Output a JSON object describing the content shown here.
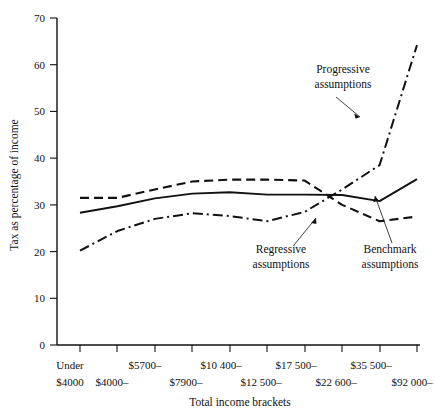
{
  "chart_data": {
    "type": "line",
    "title": "",
    "xlabel": "Total income brackets",
    "ylabel": "Tax as percentage of income",
    "ylim": [
      0,
      70
    ],
    "yticks": [
      0,
      10,
      20,
      30,
      40,
      50,
      60,
      70
    ],
    "ytick_labels": [
      "0",
      "10",
      "20",
      "30",
      "40",
      "50",
      "60",
      "70"
    ],
    "grid": false,
    "legend_position": "inline-annotations",
    "categories": [
      "Under $4000",
      "$4000–",
      "$5700–",
      "$7900–",
      "$10 400–",
      "$12 500–",
      "$17 500–",
      "$22 600–",
      "$35 500–",
      "$92 000–"
    ],
    "categories_upper": [
      "Under",
      "",
      "$5700–",
      "",
      "$10 400–",
      "",
      "$17 500–",
      "",
      "$35 500–",
      ""
    ],
    "categories_lower": [
      "$4000",
      "$4000–",
      "",
      "$7900–",
      "",
      "$12 500–",
      "",
      "$22 600–",
      "",
      "$92 000–"
    ],
    "series": [
      {
        "name": "Regressive assumptions",
        "style": "dashed",
        "values": [
          31.5,
          31.5,
          33.3,
          35.0,
          35.4,
          35.4,
          35.2,
          30.0,
          26.5,
          27.5
        ]
      },
      {
        "name": "Benchmark assumptions",
        "style": "solid",
        "values": [
          28.3,
          29.7,
          31.4,
          32.4,
          32.7,
          32.2,
          32.2,
          32.1,
          30.8,
          35.5
        ]
      },
      {
        "name": "Progressive assumptions",
        "style": "dash-dot",
        "values": [
          20.2,
          24.4,
          27.0,
          28.2,
          27.6,
          26.5,
          28.5,
          33.3,
          38.5,
          64.2
        ]
      }
    ],
    "annotations": [
      {
        "text_line1": "Progressive",
        "text_line2": "assumptions"
      },
      {
        "text_line1": "Regressive",
        "text_line2": "assumptions"
      },
      {
        "text_line1": "Benchmark",
        "text_line2": "assumptions"
      }
    ],
    "colors": {
      "axis": "#111111",
      "series": "#111111",
      "background": "#ffffff"
    }
  }
}
